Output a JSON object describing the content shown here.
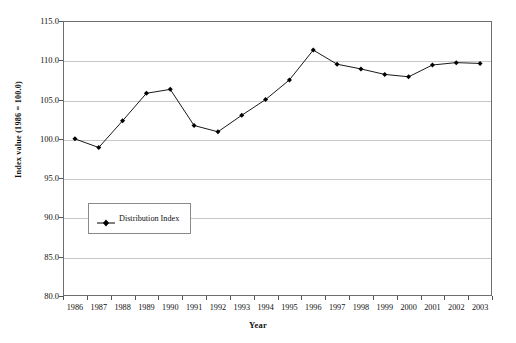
{
  "chart_data": {
    "type": "line",
    "title": "",
    "xlabel": "Year",
    "ylabel": "Index value (1986 = 100.0)",
    "categories": [
      "1986",
      "1987",
      "1988",
      "1989",
      "1990",
      "1991",
      "1992",
      "1993",
      "1994",
      "1995",
      "1996",
      "1997",
      "1998",
      "1999",
      "2000",
      "2001",
      "2002",
      "2003"
    ],
    "series": [
      {
        "name": "Distribution Index",
        "marker": "diamond",
        "color": "#000000",
        "values": [
          100.0,
          98.9,
          102.3,
          105.8,
          106.3,
          101.7,
          100.9,
          103.0,
          105.0,
          107.5,
          111.3,
          109.5,
          108.9,
          108.2,
          107.9,
          109.4,
          109.7,
          109.6
        ]
      }
    ],
    "ylim": [
      80.0,
      115.0
    ],
    "yticks": [
      "80.0",
      "85.0",
      "90.0",
      "95.0",
      "100.0",
      "105.0",
      "110.0",
      "115.0"
    ],
    "ytick_values": [
      80.0,
      85.0,
      90.0,
      95.0,
      100.0,
      105.0,
      110.0,
      115.0
    ],
    "grid": "horizontal",
    "legend_position": "inside-lower-left",
    "legend_entries": [
      "Distribution Index"
    ]
  },
  "legend": {
    "entry_label": "Distribution Index"
  },
  "axes": {
    "x_title": "Year",
    "y_title": "Index value (1986 = 100.0)"
  }
}
